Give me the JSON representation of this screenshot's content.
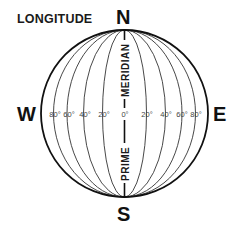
{
  "title": "LONGITUDE",
  "compass": {
    "north": "N",
    "south": "S",
    "west": "W",
    "east": "E"
  },
  "prime_meridian": {
    "upper_label": "MERIDIAN",
    "lower_label": "PRIME"
  },
  "degree_labels": {
    "west": [
      "80°",
      "60°",
      "40°",
      "20°"
    ],
    "center": "0°",
    "east": [
      "20°",
      "40°",
      "60°",
      "80°"
    ]
  },
  "colors": {
    "line": "#222222",
    "outline": "#111111",
    "background": "#ffffff"
  }
}
